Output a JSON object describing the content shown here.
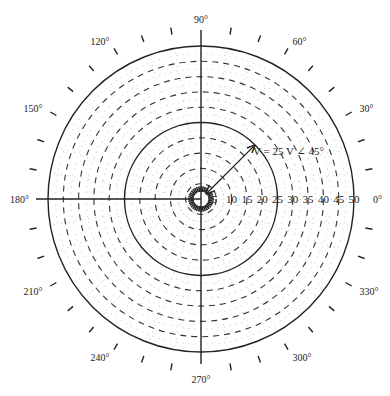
{
  "diagram": {
    "type": "polar-graph",
    "center": {
      "x": 201,
      "y": 199
    },
    "max_radius_px": 153,
    "radial_max": 50,
    "radial_step": 5,
    "radial_labels": [
      "5",
      "10",
      "15",
      "20",
      "25",
      "30",
      "35",
      "40",
      "45",
      "50"
    ],
    "solid_circles": [
      25,
      50
    ],
    "angle_step_deg": 10,
    "angle_labels": [
      {
        "deg": 0,
        "text": "0°"
      },
      {
        "deg": 30,
        "text": "30°"
      },
      {
        "deg": 60,
        "text": "60°"
      },
      {
        "deg": 90,
        "text": "90°"
      },
      {
        "deg": 120,
        "text": "120°"
      },
      {
        "deg": 150,
        "text": "150°"
      },
      {
        "deg": 180,
        "text": "180°"
      },
      {
        "deg": 210,
        "text": "210°"
      },
      {
        "deg": 240,
        "text": "240°"
      },
      {
        "deg": 270,
        "text": "270°"
      },
      {
        "deg": 300,
        "text": "300°"
      },
      {
        "deg": 330,
        "text": "330°"
      }
    ],
    "phasor": {
      "magnitude": 25,
      "angle_deg": 45,
      "label": "V = 25  V ∠ 45°"
    },
    "colors": {
      "line": "#222222",
      "dashed": "#333333",
      "dotted": "#b0b0b0",
      "text": "#222222"
    }
  }
}
